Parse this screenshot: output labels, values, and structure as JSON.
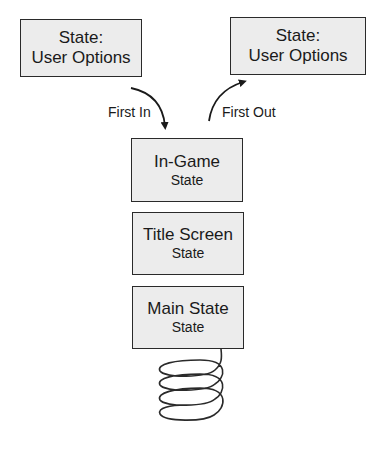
{
  "diagram": {
    "top_left_box": {
      "line1": "State:",
      "line2": "User Options"
    },
    "top_right_box": {
      "line1": "State:",
      "line2": "User Options"
    },
    "arrow_in_label": "First In",
    "arrow_out_label": "First Out",
    "stack": [
      {
        "title": "In-Game",
        "subtitle": "State"
      },
      {
        "title": "Title Screen",
        "subtitle": "State"
      },
      {
        "title": "Main State",
        "subtitle": "State"
      }
    ]
  }
}
